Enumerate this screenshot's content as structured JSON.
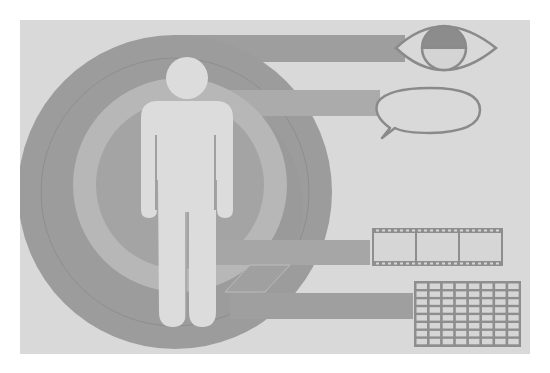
{
  "illustration": {
    "subject": "human figure with sensory and data icons",
    "colors": {
      "page": "#ffffff",
      "panel": "#d9d9d9",
      "ring_dark": "#9a9a9a",
      "ring_mid": "#a9a9a9",
      "ring_light": "#b9b9b9",
      "bar_top": "#9e9e9e",
      "bar_mid": "#aaaaaa",
      "figure": "#dcdcdc",
      "icon_stroke": "#8c8c8c",
      "icon_fill_dark": "#8a8a8a"
    },
    "icons": [
      {
        "name": "eye",
        "label": "eye-icon"
      },
      {
        "name": "speech-bubble",
        "label": "speech-bubble-icon"
      },
      {
        "name": "film-strip",
        "label": "film-strip-icon",
        "frames": 3
      },
      {
        "name": "grid-table",
        "label": "table-grid-icon",
        "rows": 8,
        "columns": 8
      }
    ]
  }
}
